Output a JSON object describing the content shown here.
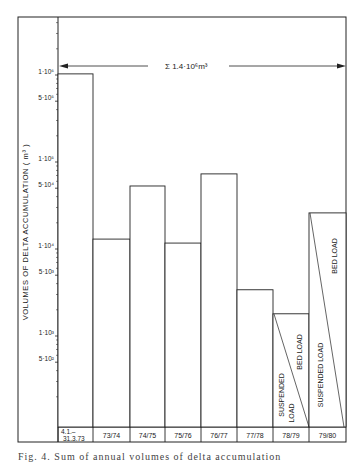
{
  "chart_data": {
    "type": "bar",
    "scale": "log",
    "title": "",
    "ylabel": "VOLUMES OF DELTA ACCUMULATION ( m³ )",
    "xlabel": "",
    "categories": [
      "4.1.– 31.3.73",
      "73/74",
      "74/75",
      "75/76",
      "76/77",
      "77/78",
      "78/79",
      "79/80"
    ],
    "values": [
      1030000,
      13000,
      53000,
      11700,
      73000,
      3400,
      1800,
      26000
    ],
    "y_ticks": [
      {
        "label": "1·10⁶",
        "value": 1000000
      },
      {
        "label": "5·10⁵",
        "value": 500000
      },
      {
        "label": "1·10⁵",
        "value": 100000
      },
      {
        "label": "5·10⁴",
        "value": 50000
      },
      {
        "label": "1·10⁴",
        "value": 10000
      },
      {
        "label": "5·10³",
        "value": 5000
      },
      {
        "label": "1·10³",
        "value": 1000
      },
      {
        "label": "5·10²",
        "value": 500
      }
    ],
    "ylim": [
      150,
      5000000
    ],
    "grid": false,
    "annotations": [
      {
        "text": "Σ 1.4·10⁶m³",
        "type": "double-arrow span across all years"
      },
      {
        "column": "78/79",
        "parts": [
          "SUSPENDED LOAD",
          "BED LOAD"
        ],
        "note": "diagonal split of bar"
      },
      {
        "column": "79/80",
        "parts": [
          "SUSPENDED LOAD",
          "BED LOAD"
        ],
        "note": "diagonal split of bar"
      }
    ],
    "legend": null
  },
  "labels": {
    "total": "Σ  1.4·10⁶m³",
    "ylabel": "VOLUMES OF DELTA ACCUMULATION ( m³ )",
    "cat0_line1": "4.1.–",
    "cat0_line2": "31.3.73",
    "suspended_load_7879_l1": "SUSPENDED",
    "suspended_load_7879_l2": "LOAD",
    "bed_load": "BED LOAD",
    "suspended_load": "SUSPENDED LOAD"
  },
  "caption": "Fig. 4.  Sum of annual  volumes of delta accumulation"
}
